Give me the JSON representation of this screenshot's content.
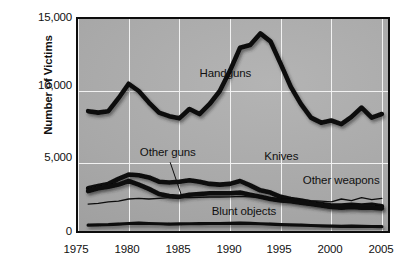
{
  "chart_data": {
    "type": "line",
    "title": "",
    "subtitle": "",
    "xlabel": "",
    "ylabel": "Number of Victims",
    "xlim": [
      1975,
      2006
    ],
    "ylim": [
      0,
      15000
    ],
    "grid": true,
    "legend_position": "inline-labels",
    "x_ticks": [
      "1975",
      "1980",
      "1985",
      "1990",
      "1995",
      "2000",
      "2005"
    ],
    "x_tick_values": [
      1975,
      1980,
      1985,
      1990,
      1995,
      2000,
      2005
    ],
    "y_ticks": [
      "0",
      "5,000",
      "10,000",
      "15,000"
    ],
    "y_tick_values": [
      0,
      5000,
      10000,
      15000
    ],
    "x": [
      1976,
      1977,
      1978,
      1979,
      1980,
      1981,
      1982,
      1983,
      1984,
      1985,
      1986,
      1987,
      1988,
      1989,
      1990,
      1991,
      1992,
      1993,
      1994,
      1995,
      1996,
      1997,
      1998,
      1999,
      2000,
      2001,
      2002,
      2003,
      2004,
      2005
    ],
    "series": [
      {
        "name": "Handguns",
        "label_x": 1987.0,
        "label_y": 11150,
        "style": "thick",
        "values": [
          8600,
          8500,
          8600,
          9500,
          10500,
          10000,
          9200,
          8500,
          8250,
          8100,
          8750,
          8400,
          9100,
          10000,
          11400,
          13000,
          13200,
          14000,
          13450,
          11900,
          10300,
          9100,
          8150,
          7800,
          7950,
          7700,
          8200,
          8850,
          8150,
          8400
        ]
      },
      {
        "name": "Knives",
        "label_x": 1993.4,
        "label_y": 5450,
        "style": "thick",
        "values": [
          3250,
          3400,
          3550,
          3900,
          4200,
          4150,
          4000,
          3700,
          3650,
          3700,
          3800,
          3700,
          3550,
          3500,
          3550,
          3750,
          3450,
          3100,
          2950,
          2650,
          2500,
          2400,
          2250,
          2150,
          2050,
          2050,
          2100,
          2050,
          2100,
          2000
        ]
      },
      {
        "name": "Other guns",
        "label_x": 1981.1,
        "label_y": 5700,
        "style": "thick",
        "leader": true,
        "leader_from_x": 1984.1,
        "leader_from_y": 5050,
        "leader_to_x": 1985.2,
        "leader_to_y": 2780,
        "values": [
          3050,
          3250,
          3350,
          3500,
          3750,
          3500,
          3200,
          2850,
          2700,
          2650,
          2800,
          2850,
          2900,
          2900,
          2900,
          2950,
          2800,
          2650,
          2500,
          2400,
          2350,
          2250,
          2150,
          2050,
          1950,
          1900,
          1950,
          1900,
          1900,
          1850
        ]
      },
      {
        "name": "Other weapons",
        "label_x": 1997.2,
        "label_y": 3750,
        "style": "thin",
        "values": [
          2150,
          2200,
          2300,
          2350,
          2500,
          2550,
          2500,
          2550,
          2600,
          2600,
          2600,
          2620,
          2640,
          2640,
          2650,
          2680,
          2650,
          2620,
          2580,
          2520,
          2480,
          2430,
          2380,
          2350,
          2300,
          2500,
          2380,
          2600,
          2450,
          2550
        ]
      },
      {
        "name": "Blunt objects",
        "label_x": 1988.2,
        "label_y": 1620,
        "style": "medium",
        "values": [
          680,
          700,
          720,
          760,
          800,
          820,
          800,
          780,
          760,
          770,
          780,
          790,
          800,
          800,
          810,
          830,
          810,
          780,
          750,
          720,
          700,
          680,
          660,
          640,
          620,
          600,
          610,
          600,
          590,
          580
        ]
      }
    ]
  },
  "colors": {
    "line": "#0d0d0d",
    "plot_background": "#a8a8a8",
    "gridline": "#f2f2f2",
    "axis": "#0d0d0d",
    "text": "#111111",
    "page_background": "#ffffff"
  }
}
